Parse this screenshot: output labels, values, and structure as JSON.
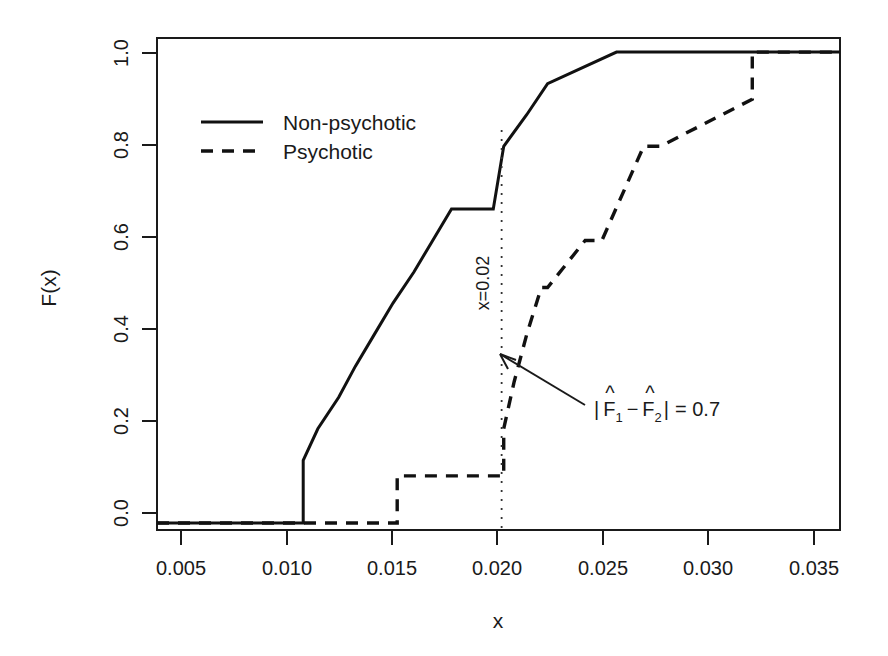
{
  "chart_data": {
    "type": "line",
    "subtype": "empirical-cdf-step",
    "title": "",
    "xlabel": "x",
    "ylabel": "F(x)",
    "xlim": [
      0.0035,
      0.0362
    ],
    "ylim": [
      -0.015,
      1.03
    ],
    "grid": false,
    "legend_position": "top-left-inside",
    "xticks": [
      0.005,
      0.01,
      0.015,
      0.02,
      0.025,
      0.03,
      0.035
    ],
    "xtick_labels": [
      "0.005",
      "0.010",
      "0.015",
      "0.020",
      "0.025",
      "0.030",
      "0.035"
    ],
    "yticks": [
      0.0,
      0.2,
      0.4,
      0.6,
      0.8,
      1.0
    ],
    "ytick_labels": [
      "0.0",
      "0.2",
      "0.4",
      "0.6",
      "0.8",
      "1.0"
    ],
    "series": [
      {
        "name": "Non-psychotic",
        "style": "solid",
        "n": 15,
        "x": [
          0.0035,
          0.0105,
          0.0105,
          0.0112,
          0.0122,
          0.013,
          0.0139,
          0.0148,
          0.0158,
          0.0167,
          0.0176,
          0.0186,
          0.0196,
          0.0201,
          0.0212,
          0.0222,
          0.0255,
          0.0362
        ],
        "y": [
          0.0,
          0.0,
          0.133,
          0.2,
          0.267,
          0.333,
          0.4,
          0.467,
          0.533,
          0.6,
          0.667,
          0.667,
          0.667,
          0.8,
          0.867,
          0.933,
          1.0,
          1.0
        ]
      },
      {
        "name": "Psychotic",
        "style": "dashed",
        "n": 10,
        "x": [
          0.0035,
          0.015,
          0.015,
          0.0201,
          0.0201,
          0.0206,
          0.0212,
          0.0219,
          0.0222,
          0.024,
          0.0248,
          0.0268,
          0.0276,
          0.032,
          0.032,
          0.0362
        ],
        "y": [
          0.0,
          0.0,
          0.1,
          0.1,
          0.2,
          0.3,
          0.4,
          0.5,
          0.5,
          0.6,
          0.6,
          0.8,
          0.8,
          0.9,
          1.0,
          1.0
        ]
      }
    ],
    "annotations": [
      {
        "id": "vertical-reference",
        "label": "x=0.02",
        "x": 0.02,
        "orientation": "vertical",
        "style": "dotted"
      },
      {
        "id": "gap-callout",
        "label_parts": {
          "open_bar": "|",
          "f1": "F",
          "f1_hat": "^",
          "f1_sub": "1",
          "minus": "−",
          "f2": "F",
          "f2_hat": "^",
          "f2_sub": "2",
          "close_bar": "|",
          "equals": "= 0.7"
        },
        "label_plain": "| F̂1 − F̂2 | = 0.7",
        "value": 0.7,
        "points_to_x": 0.02,
        "points_to_y": 0.35
      }
    ]
  },
  "legend": {
    "items": [
      {
        "label": "Non-psychotic",
        "style": "solid"
      },
      {
        "label": "Psychotic",
        "style": "dashed"
      }
    ]
  },
  "axes": {
    "x_title": "x",
    "y_title": "F(x)"
  }
}
